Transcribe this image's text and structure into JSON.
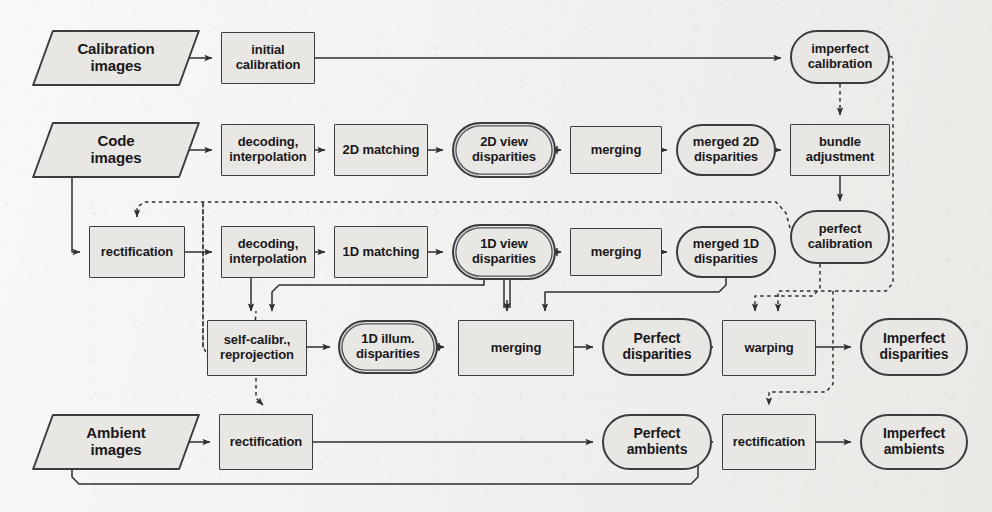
{
  "diagram": {
    "background_color": "#f2f1ef",
    "node_fill": "#e9e7e4",
    "stroke_color": "#3c3b3d",
    "nodes": [
      {
        "id": "calibration-images",
        "label": "Calibration\nimages",
        "shape": "io",
        "x": 42,
        "y": 30,
        "w": 148,
        "h": 56,
        "font": 15
      },
      {
        "id": "initial-calibration",
        "label": "initial\ncalibration",
        "shape": "process",
        "x": 221,
        "y": 32,
        "w": 94,
        "h": 52,
        "font": 13
      },
      {
        "id": "imperfect-calibration",
        "label": "imperfect\ncalibration",
        "shape": "terminal",
        "x": 790,
        "y": 30,
        "w": 100,
        "h": 54,
        "font": 13
      },
      {
        "id": "code-images",
        "label": "Code\nimages",
        "shape": "io",
        "x": 42,
        "y": 122,
        "w": 148,
        "h": 56,
        "font": 15
      },
      {
        "id": "decoding-2d",
        "label": "decoding,\ninterpolation",
        "shape": "process",
        "x": 221,
        "y": 124,
        "w": 94,
        "h": 52,
        "font": 13
      },
      {
        "id": "matching-2d",
        "label": "2D matching",
        "shape": "process",
        "x": 334,
        "y": 124,
        "w": 94,
        "h": 52,
        "font": 13
      },
      {
        "id": "view-disparities-2d",
        "label": "2D view\ndisparities",
        "shape": "terminal2",
        "x": 452,
        "y": 122,
        "w": 104,
        "h": 56,
        "font": 13
      },
      {
        "id": "merging-2d",
        "label": "merging",
        "shape": "process",
        "x": 570,
        "y": 126,
        "w": 92,
        "h": 48,
        "font": 13
      },
      {
        "id": "merged-2d",
        "label": "merged 2D\ndisparities",
        "shape": "terminal",
        "x": 676,
        "y": 124,
        "w": 100,
        "h": 52,
        "font": 13
      },
      {
        "id": "bundle-adjustment",
        "label": "bundle\nadjustment",
        "shape": "process",
        "x": 790,
        "y": 124,
        "w": 100,
        "h": 52,
        "font": 13
      },
      {
        "id": "rectification-1",
        "label": "rectification",
        "shape": "process",
        "x": 89,
        "y": 226,
        "w": 96,
        "h": 52,
        "font": 13
      },
      {
        "id": "decoding-1d",
        "label": "decoding,\ninterpolation",
        "shape": "process",
        "x": 221,
        "y": 226,
        "w": 94,
        "h": 52,
        "font": 13
      },
      {
        "id": "matching-1d",
        "label": "1D matching",
        "shape": "process",
        "x": 334,
        "y": 226,
        "w": 94,
        "h": 52,
        "font": 13
      },
      {
        "id": "view-disparities-1d",
        "label": "1D view\ndisparities",
        "shape": "terminal2",
        "x": 452,
        "y": 224,
        "w": 104,
        "h": 56,
        "font": 13
      },
      {
        "id": "merging-1d",
        "label": "merging",
        "shape": "process",
        "x": 570,
        "y": 228,
        "w": 92,
        "h": 48,
        "font": 13
      },
      {
        "id": "merged-1d",
        "label": "merged 1D\ndisparities",
        "shape": "terminal",
        "x": 676,
        "y": 226,
        "w": 100,
        "h": 52,
        "font": 13
      },
      {
        "id": "perfect-calibration",
        "label": "perfect\ncalibration",
        "shape": "terminal",
        "x": 790,
        "y": 210,
        "w": 100,
        "h": 54,
        "font": 13
      },
      {
        "id": "self-calibration",
        "label": "self-calibr.,\nreprojection",
        "shape": "process",
        "x": 207,
        "y": 320,
        "w": 100,
        "h": 56,
        "font": 13
      },
      {
        "id": "illum-disparities-1d",
        "label": "1D illum.\ndisparities",
        "shape": "terminal2",
        "x": 338,
        "y": 320,
        "w": 100,
        "h": 54,
        "font": 13
      },
      {
        "id": "merging-illum",
        "label": "merging",
        "shape": "process",
        "x": 458,
        "y": 320,
        "w": 116,
        "h": 56,
        "font": 13
      },
      {
        "id": "perfect-disparities",
        "label": "Perfect\ndisparities",
        "shape": "terminal",
        "x": 602,
        "y": 318,
        "w": 110,
        "h": 58,
        "font": 14
      },
      {
        "id": "warping",
        "label": "warping",
        "shape": "process",
        "x": 722,
        "y": 320,
        "w": 94,
        "h": 56,
        "font": 13
      },
      {
        "id": "imperfect-disparities",
        "label": "Imperfect\ndisparities",
        "shape": "terminal",
        "x": 860,
        "y": 318,
        "w": 108,
        "h": 58,
        "font": 14
      },
      {
        "id": "ambient-images",
        "label": "Ambient\nimages",
        "shape": "io",
        "x": 42,
        "y": 414,
        "w": 148,
        "h": 56,
        "font": 15
      },
      {
        "id": "rectification-2",
        "label": "rectification",
        "shape": "process",
        "x": 219,
        "y": 414,
        "w": 94,
        "h": 56,
        "font": 13
      },
      {
        "id": "perfect-ambients",
        "label": "Perfect\nambients",
        "shape": "terminal",
        "x": 602,
        "y": 414,
        "w": 110,
        "h": 56,
        "font": 14
      },
      {
        "id": "rectification-3",
        "label": "rectification",
        "shape": "process",
        "x": 722,
        "y": 414,
        "w": 94,
        "h": 56,
        "font": 13
      },
      {
        "id": "imperfect-ambients",
        "label": "Imperfect\nambients",
        "shape": "terminal",
        "x": 860,
        "y": 414,
        "w": 108,
        "h": 56,
        "font": 14
      }
    ],
    "edge_styles": {
      "solid": "solid single-line arrow",
      "double": "double parallel line arrow",
      "dotted": "dotted line arrow"
    },
    "edges": [
      {
        "from": "calibration-images",
        "to": "initial-calibration",
        "style": "solid"
      },
      {
        "from": "initial-calibration",
        "to": "imperfect-calibration",
        "style": "solid"
      },
      {
        "from": "imperfect-calibration",
        "to": "bundle-adjustment",
        "style": "dotted"
      },
      {
        "from": "code-images",
        "to": "decoding-2d",
        "style": "solid"
      },
      {
        "from": "decoding-2d",
        "to": "matching-2d",
        "style": "solid"
      },
      {
        "from": "matching-2d",
        "to": "view-disparities-2d",
        "style": "solid"
      },
      {
        "from": "view-disparities-2d",
        "to": "merging-2d",
        "style": "double"
      },
      {
        "from": "merging-2d",
        "to": "merged-2d",
        "style": "solid"
      },
      {
        "from": "merged-2d",
        "to": "bundle-adjustment",
        "style": "solid"
      },
      {
        "from": "bundle-adjustment",
        "to": "perfect-calibration",
        "style": "solid"
      },
      {
        "from": "code-images",
        "to": "rectification-1",
        "style": "solid"
      },
      {
        "from": "perfect-calibration",
        "to": "rectification-1",
        "style": "dotted"
      },
      {
        "from": "rectification-1",
        "to": "decoding-1d",
        "style": "solid"
      },
      {
        "from": "decoding-1d",
        "to": "matching-1d",
        "style": "solid"
      },
      {
        "from": "matching-1d",
        "to": "view-disparities-1d",
        "style": "solid"
      },
      {
        "from": "view-disparities-1d",
        "to": "merging-1d",
        "style": "double"
      },
      {
        "from": "merging-1d",
        "to": "merged-1d",
        "style": "solid"
      },
      {
        "from": "decoding-1d",
        "to": "self-calibration",
        "style": "solid"
      },
      {
        "from": "view-disparities-1d",
        "to": "self-calibration",
        "style": "solid"
      },
      {
        "from": "view-disparities-1d",
        "to": "merging-illum",
        "style": "double"
      },
      {
        "from": "merged-1d",
        "to": "merging-illum",
        "style": "solid"
      },
      {
        "from": "perfect-calibration",
        "to": "self-calibration",
        "style": "dotted"
      },
      {
        "from": "self-calibration",
        "to": "illum-disparities-1d",
        "style": "solid"
      },
      {
        "from": "illum-disparities-1d",
        "to": "merging-illum",
        "style": "double"
      },
      {
        "from": "merging-illum",
        "to": "perfect-disparities",
        "style": "solid"
      },
      {
        "from": "perfect-disparities",
        "to": "warping",
        "style": "solid"
      },
      {
        "from": "perfect-calibration",
        "to": "warping",
        "style": "dotted"
      },
      {
        "from": "imperfect-calibration",
        "to": "warping",
        "style": "dotted"
      },
      {
        "from": "warping",
        "to": "imperfect-disparities",
        "style": "solid"
      },
      {
        "from": "perfect-calibration",
        "to": "rectification-2",
        "style": "dotted"
      },
      {
        "from": "ambient-images",
        "to": "rectification-2",
        "style": "solid"
      },
      {
        "from": "rectification-2",
        "to": "perfect-ambients",
        "style": "solid"
      },
      {
        "from": "ambient-images",
        "to": "rectification-3",
        "style": "solid"
      },
      {
        "from": "imperfect-calibration",
        "to": "rectification-3",
        "style": "dotted"
      },
      {
        "from": "rectification-3",
        "to": "imperfect-ambients",
        "style": "solid"
      }
    ]
  }
}
